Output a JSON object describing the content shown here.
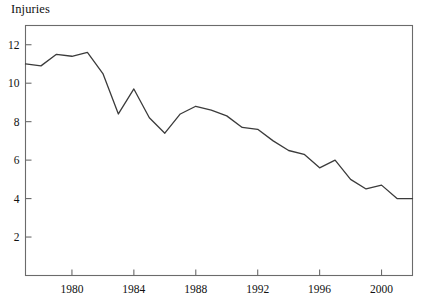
{
  "chart_data": {
    "type": "line",
    "title": "",
    "ylabel": "Injuries",
    "xlabel": "",
    "x": [
      1977,
      1978,
      1979,
      1980,
      1981,
      1982,
      1983,
      1984,
      1985,
      1986,
      1987,
      1988,
      1989,
      1990,
      1991,
      1992,
      1993,
      1994,
      1995,
      1996,
      1997,
      1998,
      1999,
      2000,
      2001,
      2002
    ],
    "values": [
      11.0,
      10.9,
      11.5,
      11.4,
      11.6,
      10.5,
      8.4,
      9.7,
      8.2,
      7.4,
      8.4,
      8.8,
      8.6,
      8.3,
      7.7,
      7.6,
      7.0,
      6.5,
      6.3,
      5.6,
      6.0,
      5.0,
      4.5,
      4.7,
      4.0,
      4.0
    ],
    "series": [
      {
        "name": "Injuries",
        "values": [
          11.0,
          10.9,
          11.5,
          11.4,
          11.6,
          10.5,
          8.4,
          9.7,
          8.2,
          7.4,
          8.4,
          8.8,
          8.6,
          8.3,
          7.7,
          7.6,
          7.0,
          6.5,
          6.3,
          5.6,
          6.0,
          5.0,
          4.5,
          4.7,
          4.0,
          4.0
        ]
      }
    ],
    "xlim": [
      1977,
      2002
    ],
    "ylim": [
      0,
      13
    ],
    "yticks": [
      2,
      4,
      6,
      8,
      10,
      12
    ],
    "ytick_labels": [
      "2",
      "4",
      "6",
      "8",
      "10",
      "12"
    ],
    "xticks": [
      1980,
      1984,
      1988,
      1992,
      1996,
      2000
    ],
    "xtick_labels": [
      "1980",
      "1984",
      "1988",
      "1992",
      "1996",
      "2000"
    ],
    "grid": false,
    "legend": "none",
    "line_color": "#3b3b3b",
    "axis_color": "#6b6b6b"
  }
}
